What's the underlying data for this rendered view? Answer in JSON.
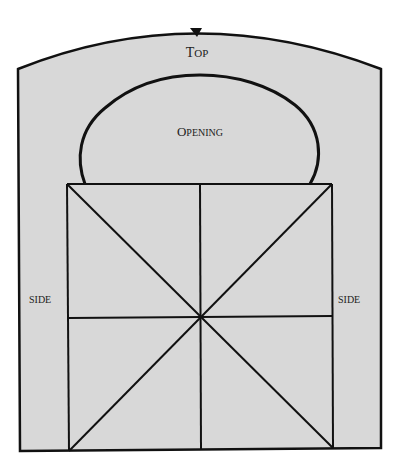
{
  "diagram": {
    "colors": {
      "fill": "#d8d8d8",
      "stroke": "#111111",
      "text": "#222222",
      "background": "#ffffff"
    },
    "labels": {
      "top": {
        "first": "T",
        "rest": "OP"
      },
      "opening": {
        "first": "O",
        "rest": "PENING"
      },
      "side_left": "SIDE",
      "side_right": "SIDE"
    },
    "marks": {
      "top_notch": "center-notch-marker"
    },
    "grid": {
      "description": "square divided into quadrants with two diagonals",
      "rows": 2,
      "cols": 2,
      "diagonals": 2
    }
  }
}
